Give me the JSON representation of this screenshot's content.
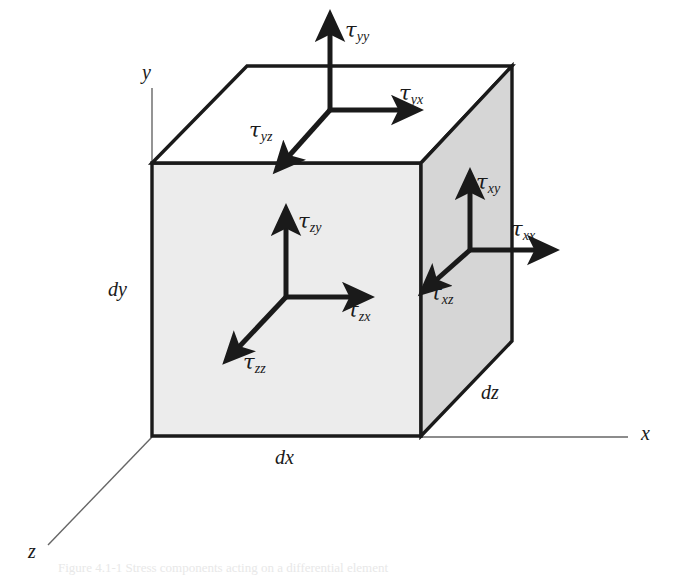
{
  "figure": {
    "type": "stress-element-diagram",
    "background_color": "#ffffff",
    "caption_partial": "Figure  4.1-1   Stress  components  acting  on  a  differential  element"
  },
  "colors": {
    "front_face_fill": "#ececec",
    "right_face_fill": "#d6d6d6",
    "top_face_fill": "#ffffff",
    "edge_stroke": "#1a1a1a",
    "axis_stroke": "#666666",
    "arrow_color": "#1a1a1a",
    "text_color": "#1a1a1a"
  },
  "axes": [
    {
      "name": "y-axis",
      "label": "y",
      "label_x": 142,
      "label_y": 62,
      "x1": 152,
      "y1": 88,
      "x2": 152,
      "y2": 163
    },
    {
      "name": "x-axis",
      "label": "x",
      "label_x": 641,
      "label_y": 423,
      "x1": 421,
      "y1": 437,
      "x2": 628,
      "y2": 437
    },
    {
      "name": "z-axis",
      "label": "z",
      "label_x": 28,
      "label_y": 541,
      "x1": 152,
      "y1": 437,
      "x2": 48,
      "y2": 545
    }
  ],
  "dimensions": [
    {
      "name": "dx",
      "label": "dx",
      "x": 275,
      "y": 447
    },
    {
      "name": "dy",
      "label": "dy",
      "x": 108,
      "y": 279
    },
    {
      "name": "dz",
      "label": "dz",
      "x": 481,
      "y": 382
    }
  ],
  "cube": {
    "front_face": "152,163 421,163 421,436 152,436",
    "top_face": "152,163 247,66 512,66 421,163",
    "right_face": "421,163 512,66 512,341 421,436"
  },
  "stress_groups": [
    {
      "name": "top-face-stresses",
      "face": "top",
      "origin_x": 330,
      "origin_y": 110,
      "arrows": [
        {
          "name": "tau-yy",
          "tau": "τ",
          "sub": "yy",
          "dir": "up",
          "tip_x": 330,
          "tip_y": 32,
          "label_x": 345,
          "label_y": 20
        },
        {
          "name": "tau-yx",
          "tau": "τ",
          "sub": "yx",
          "dir": "right",
          "tip_x": 401,
          "tip_y": 110,
          "label_x": 399,
          "label_y": 83
        },
        {
          "name": "tau-yz",
          "tau": "τ",
          "sub": "yz",
          "dir": "down-left",
          "tip_x": 288,
          "tip_y": 157,
          "label_x": 249,
          "label_y": 120
        }
      ]
    },
    {
      "name": "front-face-stresses",
      "face": "front",
      "origin_x": 286,
      "origin_y": 297,
      "arrows": [
        {
          "name": "tau-zy",
          "tau": "τ",
          "sub": "zy",
          "dir": "up",
          "tip_x": 286,
          "tip_y": 226,
          "label_x": 298,
          "label_y": 211
        },
        {
          "name": "tau-zx",
          "tau": "τ",
          "sub": "zx",
          "dir": "right",
          "tip_x": 352,
          "tip_y": 297,
          "label_x": 347,
          "label_y": 300
        },
        {
          "name": "tau-zz",
          "tau": "τ",
          "sub": "zz",
          "dir": "down-left",
          "tip_x": 238,
          "tip_y": 348,
          "label_x": 243,
          "label_y": 352
        }
      ]
    },
    {
      "name": "right-face-stresses",
      "face": "right",
      "origin_x": 470,
      "origin_y": 250,
      "arrows": [
        {
          "name": "tau-xy",
          "tau": "τ",
          "sub": "xy",
          "dir": "up",
          "tip_x": 470,
          "tip_y": 190,
          "label_x": 476,
          "label_y": 172
        },
        {
          "name": "tau-xx",
          "tau": "τ",
          "sub": "xx",
          "dir": "right",
          "tip_x": 537,
          "tip_y": 250,
          "label_x": 511,
          "label_y": 219
        },
        {
          "name": "tau-xz",
          "tau": "τ",
          "sub": "xz",
          "dir": "down-left",
          "tip_x": 435,
          "tip_y": 281,
          "label_x": 430,
          "label_y": 283
        }
      ]
    }
  ]
}
